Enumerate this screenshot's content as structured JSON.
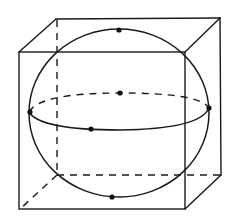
{
  "figure": {
    "stroke_color": "#1a1a1a",
    "background": "#ffffff"
  },
  "cube": {
    "front_face": {
      "x1": 19,
      "y1": 52,
      "x2": 185,
      "y2": 209
    },
    "back_face": {
      "x1": 56,
      "y1": 19,
      "x2": 220,
      "y2": 175
    },
    "hidden_edges": "dashed"
  },
  "sphere": {
    "outline": {
      "cx": 119,
      "cy": 113,
      "rx": 90,
      "ry": 84
    },
    "equator": {
      "cx": 119,
      "cy": 111,
      "rx": 90,
      "ry": 19
    },
    "points": [
      {
        "name": "top",
        "x": 119,
        "y": 30
      },
      {
        "name": "bottom",
        "x": 112,
        "y": 197
      },
      {
        "name": "center",
        "x": 120,
        "y": 93
      },
      {
        "name": "left",
        "x": 30,
        "y": 112
      },
      {
        "name": "right",
        "x": 209,
        "y": 108
      },
      {
        "name": "front",
        "x": 91,
        "y": 129
      }
    ]
  }
}
